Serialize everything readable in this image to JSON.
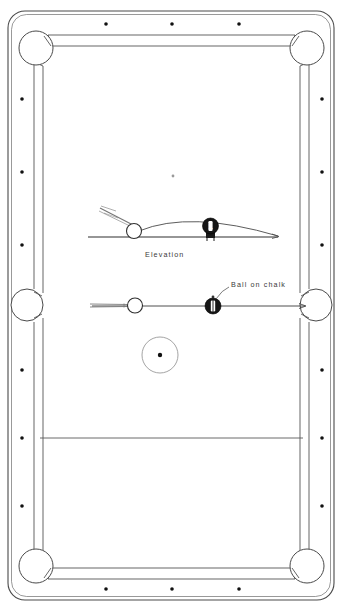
{
  "figure": {
    "background_color": "#ffffff",
    "line_color": "#4a4a4a",
    "ink_dark": "#1a1a1a",
    "spot_color": "#111111",
    "ball_fill_light": "#ffffff",
    "ball_fill_dark": "#151515"
  },
  "labels": {
    "elevation": "Elevation",
    "ball_on_chalk": "Ball on chalk"
  },
  "balls": {
    "object_ball_number": "1"
  },
  "table": {
    "pockets": [
      {
        "name": "top-left-corner-pocket",
        "cx": 36,
        "cy": 48,
        "r": 17
      },
      {
        "name": "top-right-corner-pocket",
        "cx": 307,
        "cy": 48,
        "r": 17
      },
      {
        "name": "left-side-pocket",
        "cx": 27,
        "cy": 305,
        "r": 16
      },
      {
        "name": "right-side-pocket",
        "cx": 316,
        "cy": 305,
        "r": 16
      },
      {
        "name": "bottom-left-corner-pocket",
        "cx": 36,
        "cy": 566,
        "r": 17
      },
      {
        "name": "bottom-right-corner-pocket",
        "cx": 307,
        "cy": 566,
        "r": 17
      }
    ],
    "rail_spots_top": [
      {
        "cx": 106,
        "cy": 24
      },
      {
        "cx": 172,
        "cy": 24
      },
      {
        "cx": 239,
        "cy": 24
      }
    ],
    "rail_spots_bottom": [
      {
        "cx": 106,
        "cy": 589
      },
      {
        "cx": 172,
        "cy": 589
      },
      {
        "cx": 239,
        "cy": 589
      }
    ],
    "rail_spots_left": [
      {
        "cx": 22,
        "cy": 99
      },
      {
        "cx": 22,
        "cy": 172
      },
      {
        "cx": 22,
        "cy": 245
      },
      {
        "cx": 22,
        "cy": 370
      },
      {
        "cx": 22,
        "cy": 438
      },
      {
        "cx": 22,
        "cy": 506
      }
    ],
    "rail_spots_right": [
      {
        "cx": 322,
        "cy": 99
      },
      {
        "cx": 322,
        "cy": 172
      },
      {
        "cx": 322,
        "cy": 245
      },
      {
        "cx": 322,
        "cy": 370
      },
      {
        "cx": 322,
        "cy": 438
      },
      {
        "cx": 322,
        "cy": 506
      }
    ],
    "pyramid_spot": {
      "cx": 173,
      "cy": 176
    },
    "centre_spot_circle": {
      "cx": 160,
      "cy": 355,
      "r": 18
    },
    "centre_spot": {
      "cx": 160,
      "cy": 355
    },
    "baulk_line": {
      "x1": 40,
      "y1": 438,
      "x2": 303,
      "y2": 438
    }
  }
}
